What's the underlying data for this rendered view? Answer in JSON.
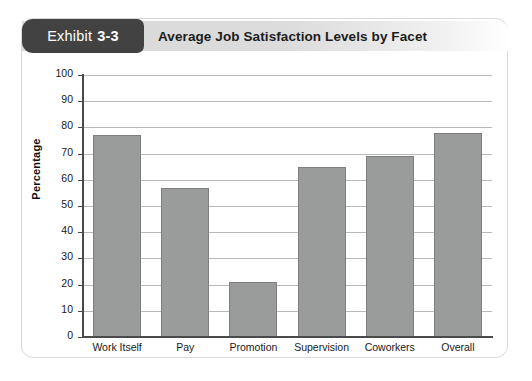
{
  "exhibit": {
    "tab_word": "Exhibit",
    "tab_number": "3-3",
    "title": "Average Job Satisfaction Levels by Facet"
  },
  "colors": {
    "tab_background": "#424242",
    "header_band": "#d9d9d9",
    "bar_fill": "#9a9b9b",
    "bar_stroke": "#7d7e7e",
    "gridline": "#b9b9b9",
    "axis": "#4a4a4a",
    "card_border": "#d8d8d8"
  },
  "chart_data": {
    "type": "bar",
    "title": "Average Job Satisfaction Levels by Facet",
    "xlabel": "",
    "ylabel": "Percentage",
    "ylim": [
      0,
      100
    ],
    "ytick_step": 10,
    "yticks": [
      100,
      90,
      80,
      70,
      60,
      50,
      40,
      30,
      20,
      10,
      0
    ],
    "grid": true,
    "legend": false,
    "categories": [
      "Work Itself",
      "Pay",
      "Promotion",
      "Supervision",
      "Coworkers",
      "Overall"
    ],
    "values": [
      77,
      57,
      21,
      65,
      69,
      78
    ]
  }
}
